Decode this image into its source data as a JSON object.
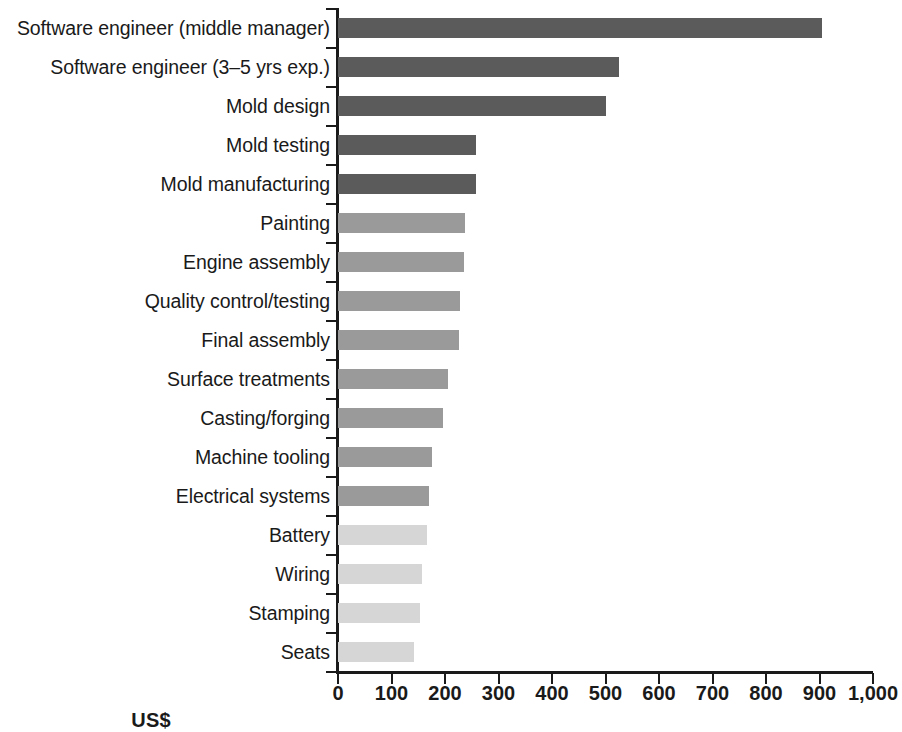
{
  "chart_data": {
    "type": "bar",
    "orientation": "horizontal",
    "title": "",
    "subtitle": "",
    "xlabel": "US$",
    "ylabel": "",
    "xlim": [
      0,
      1000
    ],
    "xticks": [
      0,
      100,
      200,
      300,
      400,
      500,
      600,
      700,
      800,
      900,
      1000
    ],
    "xtick_labels": [
      "0",
      "100",
      "200",
      "300",
      "400",
      "500",
      "600",
      "700",
      "800",
      "900",
      "1,000"
    ],
    "grid": false,
    "legend": false,
    "legend_position": "none",
    "categories": [
      "Software engineer (middle manager)",
      "Software engineer (3–5 yrs exp.)",
      "Mold design",
      "Mold testing",
      "Mold manufacturing",
      "Painting",
      "Engine assembly",
      "Quality control/testing",
      "Final assembly",
      "Surface treatments",
      "Casting/forging",
      "Machine tooling",
      "Electrical systems",
      "Battery",
      "Wiring",
      "Stamping",
      "Seats"
    ],
    "values": [
      905,
      525,
      500,
      258,
      258,
      238,
      236,
      228,
      226,
      205,
      196,
      176,
      170,
      167,
      157,
      153,
      142
    ],
    "bar_tones": [
      "dark",
      "dark",
      "dark",
      "dark",
      "dark",
      "mid",
      "mid",
      "mid",
      "mid",
      "mid",
      "mid",
      "mid",
      "mid",
      "light",
      "light",
      "light",
      "light"
    ],
    "colors": {
      "dark": "#5b5b5b",
      "mid": "#9a9a9a",
      "light": "#d6d6d6",
      "axis": "#1a1a1a",
      "background": "#ffffff"
    }
  }
}
